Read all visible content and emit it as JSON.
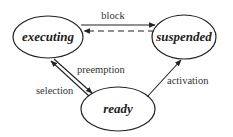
{
  "diagram": {
    "type": "state-transition",
    "colors": {
      "stroke": "#222222",
      "background": "#ffffff"
    },
    "states": [
      {
        "id": "executing",
        "label": "executing",
        "cx": 48,
        "cy": 37,
        "rx": 35,
        "ry": 21
      },
      {
        "id": "suspended",
        "label": "suspended",
        "cx": 184,
        "cy": 37,
        "rx": 32,
        "ry": 22
      },
      {
        "id": "ready",
        "label": "ready",
        "cx": 118,
        "cy": 109,
        "rx": 37,
        "ry": 22
      }
    ],
    "transitions": [
      {
        "from": "executing",
        "to": "suspended",
        "label": "block",
        "style": "solid"
      },
      {
        "from": "suspended",
        "to": "executing",
        "label": "",
        "style": "dashed"
      },
      {
        "from": "executing",
        "to": "ready",
        "label": "preemption",
        "style": "solid"
      },
      {
        "from": "ready",
        "to": "executing",
        "label": "selection",
        "style": "solid"
      },
      {
        "from": "ready",
        "to": "suspended",
        "label": "activation",
        "style": "solid"
      }
    ]
  }
}
